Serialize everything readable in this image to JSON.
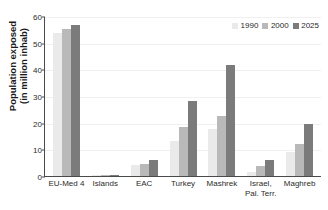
{
  "chart_data": {
    "type": "bar",
    "title": "",
    "xlabel": "",
    "ylabel_line1": "Population exposed",
    "ylabel_line2": "(in million inhab)",
    "ylim": [
      0,
      60
    ],
    "yticks": [
      0,
      10,
      20,
      30,
      40,
      50,
      60
    ],
    "grid": true,
    "legend_position": "top-right",
    "categories": [
      "EU-Med 4",
      "Islands",
      "EAC",
      "Turkey",
      "Mashrek",
      "Israel,\nPal. Terr.",
      "Maghreb"
    ],
    "category_lines": [
      [
        "EU-Med 4"
      ],
      [
        "Islands"
      ],
      [
        "EAC"
      ],
      [
        "Turkey"
      ],
      [
        "Mashrek"
      ],
      [
        "Israel,",
        "Pal. Terr."
      ],
      [
        "Maghreb"
      ]
    ],
    "series": [
      {
        "name": "1990",
        "color": "#eaeaea",
        "values": [
          53.5,
          0.2,
          4.0,
          13.0,
          17.8,
          1.4,
          9.0
        ]
      },
      {
        "name": "2000",
        "color": "#b9b9b9",
        "values": [
          55.3,
          0.3,
          4.4,
          18.2,
          22.6,
          3.8,
          11.9
        ]
      },
      {
        "name": "2025",
        "color": "#7b7b7b",
        "values": [
          56.8,
          0.5,
          6.0,
          28.0,
          41.6,
          6.0,
          19.5
        ]
      }
    ],
    "axis_color": "#4a4a4a",
    "grid_color": "#f0f0f0"
  }
}
